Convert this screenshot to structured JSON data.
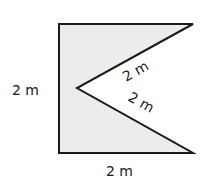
{
  "figure": {
    "type": "geometry-shape",
    "fill_color": "#ececec",
    "stroke_color": "#1a1a1a",
    "labels": {
      "left_side": "2 m",
      "bottom_side": "2 m",
      "notch_upper_edge": "2 m",
      "notch_lower_edge": "2 m"
    }
  }
}
